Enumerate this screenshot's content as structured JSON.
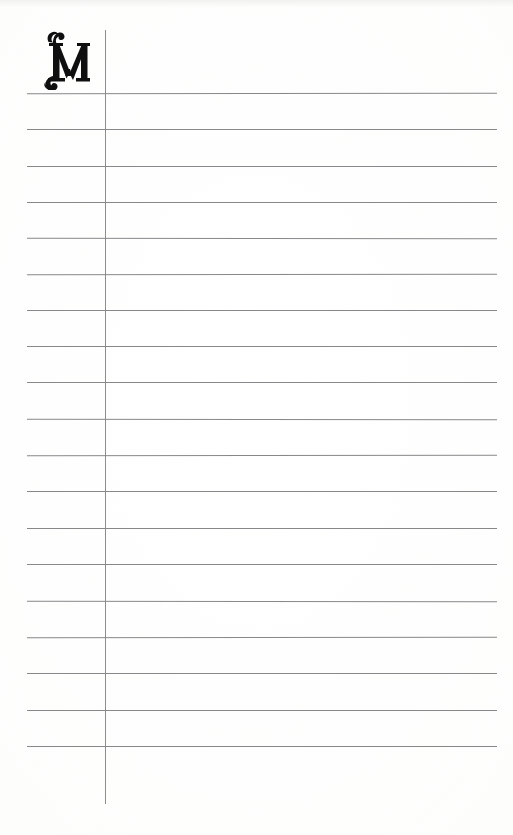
{
  "page": {
    "kind": "ruled-index-page",
    "width": 513,
    "height": 835,
    "background_color": "#fefefe",
    "paper_tone": "#f8f8f7"
  },
  "section": {
    "initial_letter": "M",
    "initial_style": "ornate-serif-swash",
    "initial_color": "#100f10",
    "x": 38,
    "y": 28,
    "width": 52,
    "height": 62
  },
  "margin_rule": {
    "name": "vertical-margin-rule",
    "color": "#85858a",
    "x": 105,
    "y_start": 30,
    "y_end": 804,
    "thickness": 1
  },
  "ruling": {
    "color": "#7e7e80",
    "thickness": 1,
    "x_start": 27,
    "x_end": 497,
    "count": 19,
    "first_y": 93,
    "spacing": 36.3,
    "line_y": [
      93,
      129,
      166,
      202,
      238,
      274,
      310,
      346,
      382,
      419,
      455,
      491,
      528,
      564,
      601,
      637,
      673,
      710,
      746
    ]
  }
}
